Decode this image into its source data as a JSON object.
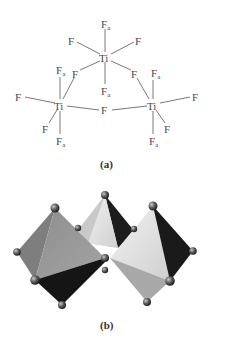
{
  "figure": {
    "panel_a": {
      "caption": "(a)",
      "central_atom": "Ti",
      "axial_label": "F",
      "axial_subscript": "a",
      "bridging_label": "F",
      "terminal_label": "F",
      "units": [
        {
          "name": "top-octahedron",
          "center": "Ti",
          "ligands": [
            "Fa",
            "F",
            "F",
            "F",
            "F",
            "Fa"
          ]
        },
        {
          "name": "left-octahedron",
          "center": "Ti",
          "ligands": [
            "Fa",
            "F",
            "F",
            "F",
            "F",
            "Fa"
          ]
        },
        {
          "name": "right-octahedron",
          "center": "Ti",
          "ligands": [
            "Fa",
            "F",
            "F",
            "F",
            "F",
            "Fa"
          ]
        }
      ]
    },
    "panel_b": {
      "caption": "(b)",
      "description": "Three corner-sharing TiF6 octahedra rendered as shaded polyhedra"
    },
    "colors": {
      "background": "#ffffff",
      "text": "#4a4a4a",
      "bond": "#6a6a6a",
      "face_light": "#e6e6e6",
      "face_mid": "#9a9a9a",
      "face_dark": "#1a1a1a",
      "sphere": "#5a5a5a"
    }
  }
}
